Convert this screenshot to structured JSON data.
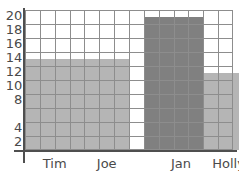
{
  "chart_data": {
    "type": "bar",
    "title": "",
    "subtitle": "",
    "xlabel": "",
    "ylabel": "",
    "categories": [
      "Tim",
      "Joe",
      "Jan",
      "Holly"
    ],
    "values": [
      13,
      13,
      19,
      11
    ],
    "series": [
      {
        "name": "",
        "values": [
          13,
          13,
          19,
          11
        ]
      }
    ],
    "ylim": [
      0,
      20
    ],
    "y_tick_labels": [
      "20",
      "18",
      "16",
      "14",
      "12",
      "10",
      "8",
      "4",
      "2"
    ],
    "y_tick_values": [
      20,
      18,
      16,
      14,
      12,
      10,
      8,
      4,
      2
    ],
    "x_tick_labels": [
      "Tim",
      "Joe",
      "Jan",
      "Holly"
    ],
    "grid": true,
    "grid_rows": 10,
    "grid_columns": 14,
    "grid_row_value_step": 2,
    "legend": false,
    "legend_position": "none",
    "annotations": [],
    "bars": [
      {
        "label": "Tim",
        "value": 13,
        "color": "#b5b5b5",
        "start_column": 0,
        "span_columns": 7,
        "label_center_column": 1.5
      },
      {
        "label": "Joe",
        "value": 13,
        "color": "#b5b5b5",
        "start_column": 0,
        "span_columns": 7,
        "label_center_column": 5.0
      },
      {
        "label": "Jan",
        "value": 19,
        "color": "#808080",
        "start_column": 8,
        "span_columns": 4,
        "label_center_column": 10.0
      },
      {
        "label": "Holly",
        "value": 11,
        "color": "#b5b5b5",
        "start_column": 12,
        "span_columns": 3,
        "label_center_column": 13.2
      }
    ]
  },
  "colors": {
    "bar_light": "#b5b5b5",
    "bar_dark": "#808080",
    "gridline": "#8d8d8d",
    "axis_line": "#4f4f4f",
    "label_text": "#4a4a4a",
    "background": "#ffffff"
  }
}
